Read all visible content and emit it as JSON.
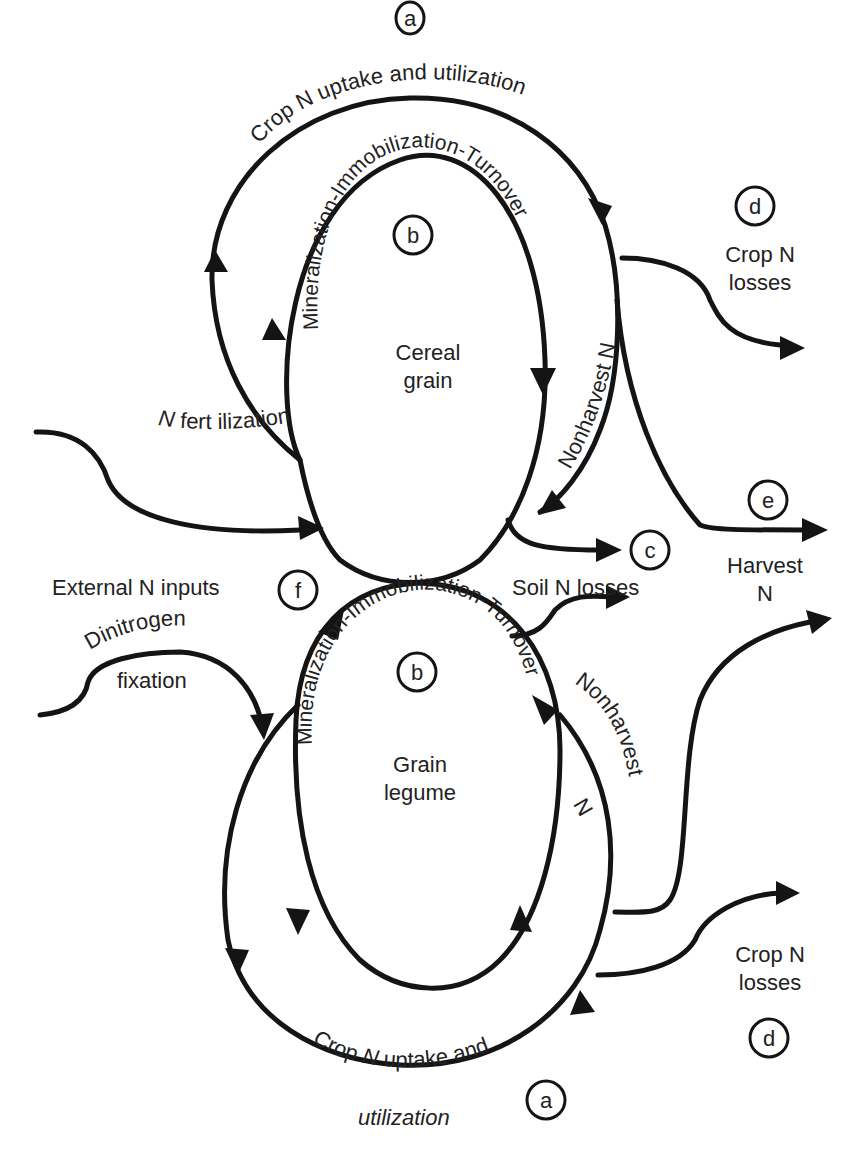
{
  "diagram": {
    "nodes": {
      "cereal": {
        "line1": "Cereal",
        "line2": "grain"
      },
      "legume": {
        "line1": "Grain",
        "line2": "legume"
      }
    },
    "markers": {
      "a_top": "a",
      "b_top": "b",
      "c": "c",
      "d_top": "d",
      "e": "e",
      "f": "f",
      "b_bottom": "b",
      "d_bottom": "d",
      "a_bottom": "a"
    },
    "labels": {
      "crop_uptake_top": "Crop N uptake and utilization",
      "mit_top": "Mineralization-Immobilization-Turnover",
      "nonharvest_top": "Nonharvest N",
      "crop_losses_top_1": "Crop N",
      "crop_losses_top_2": "losses",
      "n_fert_italic": "N",
      "n_fert_rest": " fert ilization",
      "external_inputs": "External N inputs",
      "soil_losses": "Soil N losses",
      "harvest_1": "Harvest",
      "harvest_2": "N",
      "dinitrogen_1": "Dinitrogen",
      "dinitrogen_2": "fixation",
      "mit_bottom": "Mineralization-Immobilization-Turnover",
      "nonharvest_bottom_1": "Nonharvest",
      "nonharvest_bottom_2": "N",
      "crop_losses_bottom_1": "Crop N",
      "crop_losses_bottom_2": "losses",
      "crop_uptake_bottom_pre": "Crop ",
      "crop_uptake_bottom_n": "N",
      "crop_uptake_bottom_post": " uptake and",
      "crop_uptake_bottom_2": "utilization"
    }
  }
}
